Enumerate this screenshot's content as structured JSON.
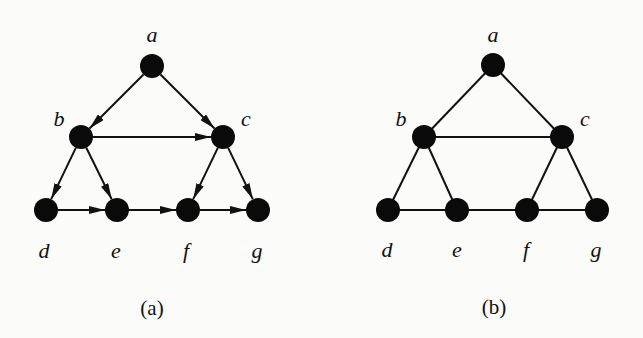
{
  "figure": {
    "panels": [
      {
        "id": "a",
        "caption": "(a)",
        "directed": true,
        "nodes": [
          {
            "id": "a",
            "label": "a",
            "x": 152,
            "y": 66,
            "lx": 152,
            "ly": 42
          },
          {
            "id": "b",
            "label": "b",
            "x": 81,
            "y": 137,
            "lx": 59,
            "ly": 126
          },
          {
            "id": "c",
            "label": "c",
            "x": 223,
            "y": 137,
            "lx": 246,
            "ly": 126
          },
          {
            "id": "d",
            "label": "d",
            "x": 46,
            "y": 210,
            "lx": 44,
            "ly": 258
          },
          {
            "id": "e",
            "label": "e",
            "x": 117,
            "y": 210,
            "lx": 116,
            "ly": 258
          },
          {
            "id": "f",
            "label": "f",
            "x": 188,
            "y": 210,
            "lx": 186,
            "ly": 258
          },
          {
            "id": "g",
            "label": "g",
            "x": 258,
            "y": 210,
            "lx": 257,
            "ly": 258
          }
        ],
        "edges": [
          [
            "a",
            "b"
          ],
          [
            "a",
            "c"
          ],
          [
            "b",
            "c"
          ],
          [
            "b",
            "d"
          ],
          [
            "b",
            "e"
          ],
          [
            "c",
            "f"
          ],
          [
            "c",
            "g"
          ],
          [
            "d",
            "e"
          ],
          [
            "e",
            "f"
          ],
          [
            "f",
            "g"
          ]
        ],
        "caption_pos": {
          "x": 152,
          "y": 315
        }
      },
      {
        "id": "b",
        "caption": "(b)",
        "directed": false,
        "nodes": [
          {
            "id": "a",
            "label": "a",
            "x": 493,
            "y": 65,
            "lx": 493,
            "ly": 42
          },
          {
            "id": "b",
            "label": "b",
            "x": 424,
            "y": 137,
            "lx": 401,
            "ly": 126
          },
          {
            "id": "c",
            "label": "c",
            "x": 562,
            "y": 137,
            "lx": 585,
            "ly": 126
          },
          {
            "id": "d",
            "label": "d",
            "x": 388,
            "y": 210,
            "lx": 387,
            "ly": 257
          },
          {
            "id": "e",
            "label": "e",
            "x": 457,
            "y": 210,
            "lx": 457,
            "ly": 257
          },
          {
            "id": "f",
            "label": "f",
            "x": 527,
            "y": 210,
            "lx": 526,
            "ly": 257
          },
          {
            "id": "g",
            "label": "g",
            "x": 597,
            "y": 210,
            "lx": 596,
            "ly": 257
          }
        ],
        "edges": [
          [
            "a",
            "b"
          ],
          [
            "a",
            "c"
          ],
          [
            "b",
            "c"
          ],
          [
            "b",
            "d"
          ],
          [
            "b",
            "e"
          ],
          [
            "c",
            "f"
          ],
          [
            "c",
            "g"
          ],
          [
            "d",
            "e"
          ],
          [
            "e",
            "f"
          ],
          [
            "f",
            "g"
          ]
        ],
        "caption_pos": {
          "x": 494,
          "y": 314
        }
      }
    ],
    "node_radius": 12,
    "colors": {
      "node": "#0a0a0a",
      "edge": "#111111",
      "background": "#fbfbfa"
    }
  }
}
